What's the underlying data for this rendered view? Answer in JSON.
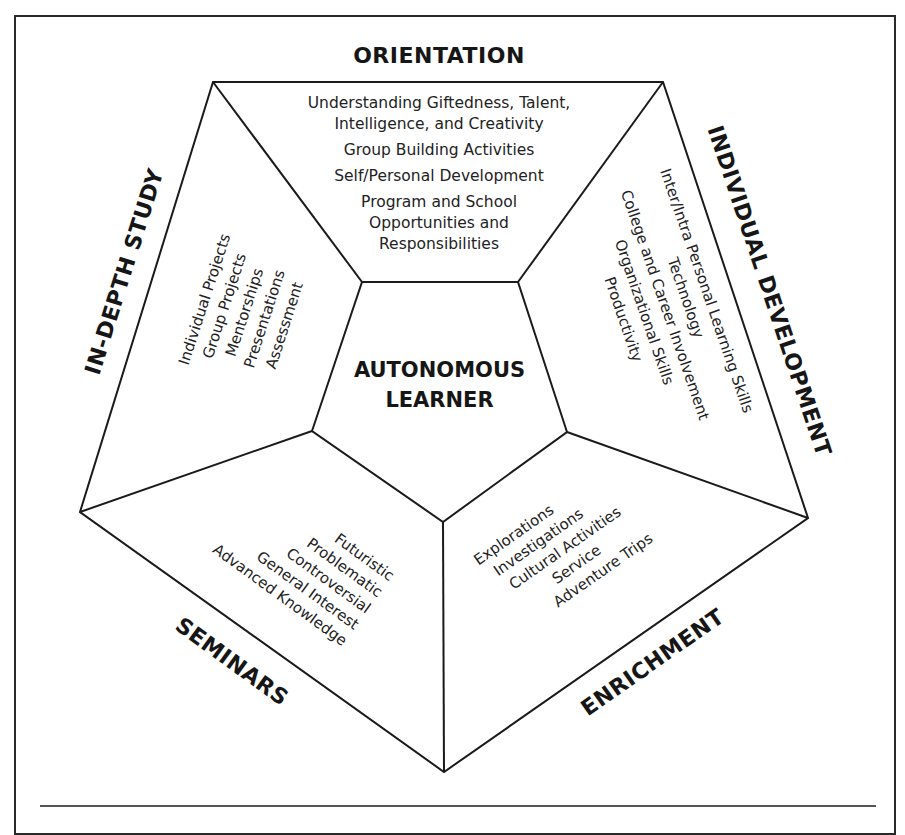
{
  "diagram": {
    "center": {
      "title_lines": [
        "AUTONOMOUS",
        "LEARNER"
      ]
    },
    "sections": {
      "orientation": {
        "heading": "ORIENTATION",
        "items": [
          "Understanding Giftedness, Talent,",
          "Intelligence, and Creativity",
          "Group Building Activities",
          "Self/Personal Development",
          "Program and School",
          "Opportunities and",
          "Responsibilities"
        ]
      },
      "individual_development": {
        "heading": "INDIVIDUAL DEVELOPMENT",
        "items": [
          "Inter/Intra Personal Learning Skills",
          "Technology",
          "College and Career Involvement",
          "Organizational Skills",
          "Productivity"
        ]
      },
      "enrichment": {
        "heading": "ENRICHMENT",
        "items": [
          "Explorations",
          "Investigations",
          "Cultural Activities",
          "Service",
          "Adventure Trips"
        ]
      },
      "seminars": {
        "heading": "SEMINARS",
        "items": [
          "Futuristic",
          "Problematic",
          "Controversial",
          "General Interest",
          "Advanced Knowledge"
        ]
      },
      "in_depth_study": {
        "heading": "IN-DEPTH STUDY",
        "items": [
          "Individual Projects",
          "Group Projects",
          "Mentorships",
          "Presentations",
          "Assessment"
        ]
      }
    },
    "colors": {
      "line": "#1a1a1a",
      "background": "#ffffff",
      "text": "#1a1a1a"
    }
  }
}
